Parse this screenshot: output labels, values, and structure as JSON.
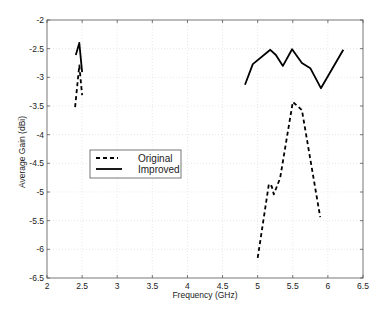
{
  "chart_data": {
    "type": "line",
    "title": "",
    "xlabel": "Frequency (GHz)",
    "ylabel": "Average Gain (dBi)",
    "xlim": [
      2,
      6.5
    ],
    "ylim": [
      -6.5,
      -2
    ],
    "xticks": [
      2,
      2.5,
      3,
      3.5,
      4,
      4.5,
      5,
      5.5,
      6,
      6.5
    ],
    "xtick_labels": [
      "2",
      "2.5",
      "3",
      "3.5",
      "4",
      "4.5",
      "5",
      "5.5",
      "6",
      "6.5"
    ],
    "yticks": [
      -2,
      -2.5,
      -3,
      -3.5,
      -4,
      -4.5,
      -5,
      -5.5,
      -6,
      -6.5
    ],
    "ytick_labels": [
      "-2",
      "-2.5",
      "-3",
      "-3.5",
      "-4",
      "-4.5",
      "-5",
      "-5.5",
      "-6",
      "-6.5"
    ],
    "grid": true,
    "legend_position": "center-left",
    "series": [
      {
        "name": "Original",
        "style": "dashed",
        "color": "#000000",
        "segments": [
          [
            [
              2.4,
              -3.52
            ],
            [
              2.46,
              -2.79
            ],
            [
              2.5,
              -3.31
            ]
          ],
          [
            [
              5.0,
              -6.15
            ],
            [
              5.16,
              -4.86
            ],
            [
              5.2,
              -4.9
            ],
            [
              5.23,
              -5.04
            ],
            [
              5.32,
              -4.76
            ],
            [
              5.5,
              -3.43
            ],
            [
              5.63,
              -3.57
            ],
            [
              5.89,
              -5.44
            ]
          ]
        ]
      },
      {
        "name": "Improved",
        "style": "solid",
        "color": "#000000",
        "segments": [
          [
            [
              2.41,
              -2.61
            ],
            [
              2.46,
              -2.4
            ],
            [
              2.5,
              -2.91
            ]
          ],
          [
            [
              4.82,
              -3.13
            ],
            [
              4.93,
              -2.77
            ],
            [
              5.18,
              -2.52
            ],
            [
              5.26,
              -2.61
            ],
            [
              5.36,
              -2.8
            ],
            [
              5.49,
              -2.51
            ],
            [
              5.63,
              -2.75
            ],
            [
              5.75,
              -2.84
            ],
            [
              5.9,
              -3.19
            ],
            [
              6.22,
              -2.52
            ]
          ]
        ]
      }
    ]
  },
  "legend": {
    "items": [
      {
        "label": "Original",
        "style": "dashed"
      },
      {
        "label": "Improved",
        "style": "solid"
      }
    ]
  }
}
